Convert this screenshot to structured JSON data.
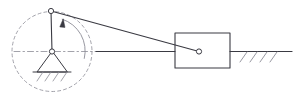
{
  "diagram": {
    "type": "slider-crank-mechanism",
    "canvas": {
      "width": 298,
      "height": 101
    },
    "colors": {
      "background": "#ffffff",
      "line": "#3a3a42",
      "line_light": "#8c8c96",
      "joint_fill": "#ffffff"
    },
    "stroke_widths": {
      "member": 1.0,
      "construction": 0.8,
      "ground": 1.2,
      "hatch": 0.8
    },
    "points": {
      "crank_center": {
        "label": "O",
        "x": 52,
        "y": 51.5
      },
      "crank_pin": {
        "label": "A",
        "x": 51,
        "y": 11
      },
      "slider_pin": {
        "label": "B",
        "x": 199,
        "y": 51.5
      }
    },
    "crank_circle": {
      "name": "crank-path",
      "cx": 52,
      "cy": 51.5,
      "r": 40,
      "dash": "3,3"
    },
    "crank_arm": {
      "name": "crank-arm",
      "from": {
        "x": 52,
        "y": 51.5
      },
      "to": {
        "x": 51,
        "y": 11
      }
    },
    "connecting_rod": {
      "name": "connecting-rod",
      "from": {
        "x": 51,
        "y": 11
      },
      "to": {
        "x": 199,
        "y": 51.5
      }
    },
    "centerline": {
      "name": "axis-centerline",
      "dashed_segment": {
        "x1": 14,
        "y1": 51.5,
        "x2": 96,
        "y2": 51.5,
        "dash": "6,3,1.5,3"
      },
      "solid_segment": {
        "x1": 96,
        "y1": 51.5,
        "x2": 175,
        "y2": 51.5
      }
    },
    "ground_pivot": {
      "name": "ground-pivot-support",
      "apex": {
        "x": 52,
        "y": 51.5
      },
      "base_left": {
        "x": 37,
        "y": 72
      },
      "base_right": {
        "x": 67,
        "y": 72
      },
      "base_line": {
        "x1": 33,
        "y1": 72,
        "x2": 71,
        "y2": 72
      },
      "hatch_count": 4
    },
    "slider_block": {
      "name": "slider-block",
      "x": 175,
      "y": 33,
      "width": 55,
      "height": 35
    },
    "slider_guide": {
      "name": "guide-ground-line",
      "line": {
        "x1": 230,
        "y1": 51.5,
        "x2": 292,
        "y2": 51.5
      },
      "hatch_count": 4
    },
    "rotation_arrow": {
      "name": "rotation-direction-arrow",
      "direction": "counterclockwise",
      "arc": {
        "cx": 52,
        "cy": 51.5,
        "r": 33,
        "start_angle_deg": 12,
        "end_angle_deg": 72
      }
    },
    "joint_radius": 2.6
  }
}
